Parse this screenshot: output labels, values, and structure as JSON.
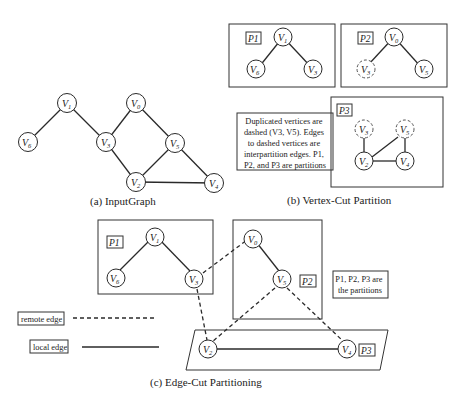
{
  "panels": {
    "a": {
      "caption": "(a)  InputGraph",
      "vertices": [
        {
          "id": "V1",
          "name": "V",
          "sub": "1"
        },
        {
          "id": "V6",
          "name": "V",
          "sub": "6"
        },
        {
          "id": "V3",
          "name": "V",
          "sub": "3"
        },
        {
          "id": "V0",
          "name": "V",
          "sub": "0"
        },
        {
          "id": "V5",
          "name": "V",
          "sub": "5"
        },
        {
          "id": "V2",
          "name": "V",
          "sub": "2"
        },
        {
          "id": "V4",
          "name": "V",
          "sub": "4"
        }
      ],
      "edges": [
        [
          "V1",
          "V6"
        ],
        [
          "V1",
          "V3"
        ],
        [
          "V0",
          "V3"
        ],
        [
          "V0",
          "V5"
        ],
        [
          "V3",
          "V2"
        ],
        [
          "V5",
          "V2"
        ],
        [
          "V5",
          "V4"
        ],
        [
          "V2",
          "V4"
        ]
      ]
    },
    "b": {
      "caption": "(b)  Vertex-Cut Partition",
      "partitions": [
        {
          "label": "P1",
          "vertices": [
            "V1",
            "V6",
            "V3"
          ],
          "dashed": []
        },
        {
          "label": "P2",
          "vertices": [
            "V0",
            "V3",
            "V5"
          ],
          "dashed": [
            "V3"
          ]
        },
        {
          "label": "P3",
          "vertices": [
            "V3",
            "V5",
            "V2",
            "V4"
          ],
          "dashed": [
            "V3",
            "V5"
          ]
        }
      ],
      "note": {
        "line1": "Duplicated vertices are",
        "line2": "dashed (V3, V5). Edges",
        "line3": "to dashed vertices are",
        "line4": "interpartition edges. P1,",
        "line5": "P2, and P3 are partitions"
      }
    },
    "c": {
      "caption": "(c)  Edge-Cut Partitioning",
      "partitions": [
        {
          "label": "P1",
          "vertices": [
            "V1",
            "V6",
            "V3"
          ]
        },
        {
          "label": "P2",
          "vertices": [
            "V0",
            "V5"
          ]
        },
        {
          "label": "P3",
          "vertices": [
            "V2",
            "V4"
          ]
        }
      ],
      "note": {
        "line1": "P1, P2, P3 are",
        "line2": "the partitions"
      },
      "legend": {
        "remote_edge": "remote edge",
        "local_edge": "local edge"
      }
    }
  },
  "labels": {
    "V": "V",
    "s0": "0",
    "s1": "1",
    "s2": "2",
    "s3": "3",
    "s4": "4",
    "s5": "5",
    "s6": "6",
    "P1": "P1",
    "P2": "P2",
    "P3": "P3"
  }
}
